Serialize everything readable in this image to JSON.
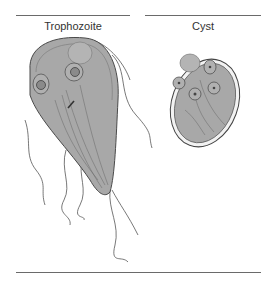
{
  "panels": [
    {
      "label": "Trophozoite"
    },
    {
      "label": "Cyst"
    }
  ],
  "colors": {
    "cell_fill": "#a8a8a8",
    "cell_outline": "#555555",
    "cyst_wall": "#f2f2f2",
    "rule": "#6a6a6a"
  }
}
